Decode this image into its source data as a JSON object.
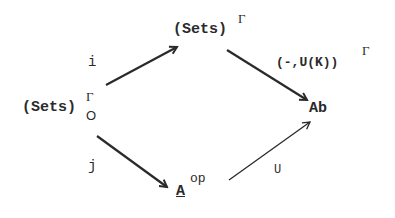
{
  "diagram": {
    "type": "commutative-diagram",
    "nodes": {
      "source": {
        "base": "(Sets)",
        "sup": "Γ",
        "sub": "O"
      },
      "top": {
        "base": "(Sets)",
        "sup": "Γ"
      },
      "target": {
        "base": "Ab"
      },
      "bottom": {
        "base": "A",
        "sup": "op"
      }
    },
    "arrows": {
      "i": {
        "label": "i",
        "from": "(Sets)_O^Γ",
        "to": "(Sets)^Γ"
      },
      "hom": {
        "label_base": "(-,U(K))",
        "label_sup": "Γ",
        "from": "(Sets)^Γ",
        "to": "Ab"
      },
      "j": {
        "label": "j",
        "from": "(Sets)_O^Γ",
        "to": "A^op"
      },
      "U": {
        "label": "U",
        "from": "A^op",
        "to": "Ab"
      }
    },
    "colors": {
      "ink": "#2a2a2a",
      "background": "#ffffff"
    }
  }
}
